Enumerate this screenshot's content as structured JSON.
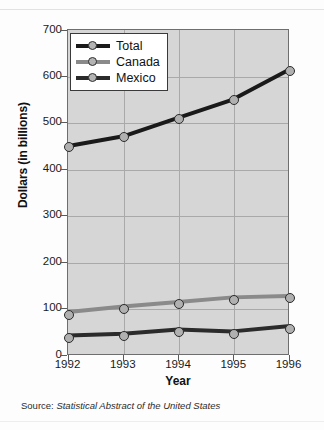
{
  "chart_data": {
    "type": "line",
    "title": "",
    "xlabel": "Year",
    "ylabel": "Dollars (in billions)",
    "categories": [
      "1992",
      "1993",
      "1994",
      "1995",
      "1996"
    ],
    "x": [
      1992,
      1993,
      1994,
      1995,
      1996
    ],
    "xlim": [
      1992,
      1996
    ],
    "ylim": [
      0,
      700
    ],
    "yticks": [
      "0",
      "100",
      "200",
      "300",
      "400",
      "500",
      "600",
      "700"
    ],
    "ytick_values": [
      0,
      100,
      200,
      300,
      400,
      500,
      600,
      700
    ],
    "grid": true,
    "legend_position": "top-left",
    "series": [
      {
        "name": "Total",
        "color": "#1a1a1a",
        "values": [
          449,
          470,
          510,
          550,
          613
        ]
      },
      {
        "name": "Canada",
        "color": "#8a8a8a",
        "values": [
          88,
          100,
          110,
          120,
          123
        ]
      },
      {
        "name": "Mexico",
        "color": "#2b2b2b",
        "values": [
          37,
          41,
          50,
          46,
          57
        ]
      }
    ]
  },
  "source": {
    "prefix": "Source:",
    "title": "Statistical Abstract of the United States"
  }
}
